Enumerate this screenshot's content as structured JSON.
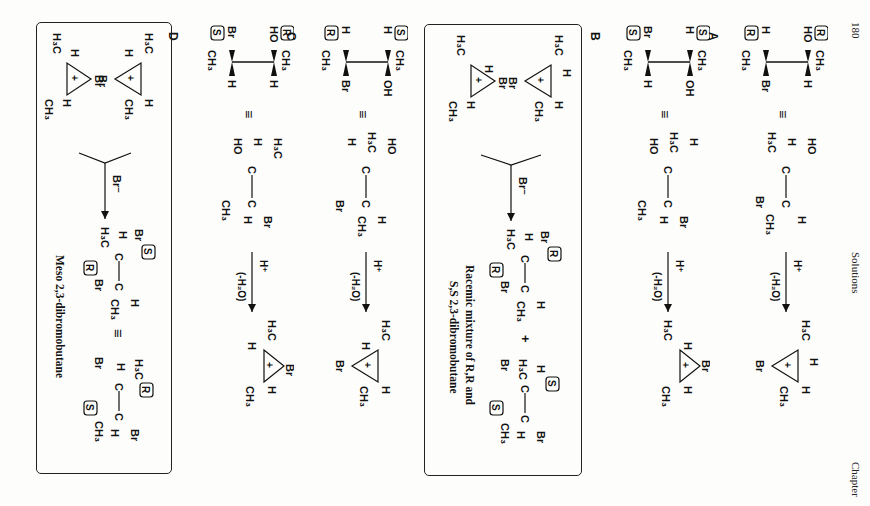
{
  "header": {
    "page_number": "180",
    "section": "Solutions",
    "chapter": "Chapter"
  },
  "rows": [
    {
      "label": "A",
      "newman": {
        "top_left": "HO",
        "top_right": "CH3",
        "mid_left": "H",
        "mid_right": "H",
        "bot_left": "H",
        "bot_right": "Br",
        "bottom": "CH3",
        "config_top": "R",
        "config_bottom": "R"
      },
      "equiv": "≡",
      "sawhorse": {
        "c1": [
          "HO",
          "H",
          "H3C"
        ],
        "c2": [
          "H",
          "CH3",
          "Br"
        ]
      },
      "reagent_top": "H+",
      "reagent_bottom": "(-H2O)",
      "bromonium": {
        "top_left": "H3C",
        "top_right": "H",
        "bridge": "Br",
        "bot_right": "H",
        "bot_left": "CH3",
        "charge": "+"
      }
    },
    {
      "label": "B",
      "newman": {
        "top_left": "H",
        "top_right": "CH3",
        "mid_left": "OH",
        "bot_left": "Br",
        "bot_right": "H",
        "bottom": "CH3",
        "config_top": "S",
        "config_bottom": "S"
      },
      "equiv": "≡",
      "sawhorse": {
        "c1": [
          "H3C",
          "H",
          "HO"
        ],
        "c2": [
          "Br",
          "H",
          "CH3"
        ]
      },
      "reagent_top": "H+",
      "reagent_bottom": "(-H2O)",
      "bromonium": {
        "top_left": "H3C",
        "top_right": "H",
        "bridge": "Br",
        "bot_right": "H",
        "bot_left": "CH3",
        "charge": "+"
      }
    },
    {
      "label": "C",
      "newman": {
        "top_left": "H",
        "top_right": "CH3",
        "mid_left": "OH",
        "bot_left": "H",
        "bot_right": "Br",
        "bottom": "CH3",
        "config_top": "S",
        "config_bottom": "R"
      },
      "equiv": "≡",
      "sawhorse": {
        "c1": [
          "HO",
          "H3C",
          "H"
        ],
        "c2": [
          "H",
          "CH3",
          "Br"
        ]
      },
      "reagent_top": "H+",
      "reagent_bottom": "(-H2O)",
      "bromonium": {
        "top_left": "H3C",
        "top_right": "H",
        "bridge": "Br",
        "bot_right": "H",
        "bot_left": "CH3",
        "charge": "+"
      }
    },
    {
      "label": "D",
      "newman": {
        "top_left": "HO",
        "top_right": "CH3",
        "mid_left": "H",
        "bot_left": "Br",
        "bot_right": "H",
        "bottom": "CH3",
        "config_top": "R",
        "config_bottom": "S"
      },
      "equiv": "≡",
      "sawhorse": {
        "c1": [
          "H3C",
          "H",
          "HO"
        ],
        "c2": [
          "Br",
          "H",
          "CH3"
        ]
      },
      "reagent_top": "H+",
      "reagent_bottom": "(-H2O)",
      "bromonium": {
        "top_left": "H3C",
        "top_right": "Br",
        "bridge": "Br",
        "bot_right": "H",
        "bot_left": "CH3",
        "charge": "+"
      }
    }
  ],
  "box_rr_ss": {
    "reagent": "Br−",
    "product_1": {
      "config_1": "R",
      "config_2": "R"
    },
    "plus": "+",
    "product_2": {
      "config_1": "S",
      "config_2": "S"
    },
    "caption_line1": "Racemic mixture of R,R and",
    "caption_line2": "S,S 2,3-dibromobutane"
  },
  "box_meso": {
    "reagent": "Br−",
    "product_1": {
      "config_1": "S",
      "config_2": "R"
    },
    "equiv": "≡",
    "product_2": {
      "config_1": "R",
      "config_2": "S"
    },
    "caption": "Meso 2,3-dibromobutane"
  }
}
